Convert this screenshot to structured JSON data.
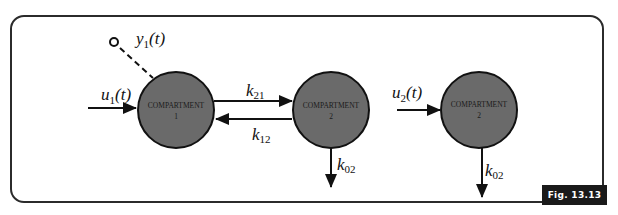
{
  "figure": {
    "label": "Fig. 13.13",
    "colors": {
      "compartment_fill": "#6a6a6a",
      "stroke": "#111111",
      "frame": "#2b2b2b",
      "label_bg": "#1a1a1a",
      "label_text": "#ffffff"
    }
  },
  "left_model": {
    "compartment1": {
      "name": "COMPARTMENT",
      "number": "1"
    },
    "compartment2": {
      "name": "COMPARTMENT",
      "number": "2"
    },
    "input": {
      "symbol": "u",
      "subscript": "1",
      "arg": "(t)"
    },
    "output": {
      "symbol": "y",
      "subscript": "1",
      "arg": "(t)"
    },
    "k21": {
      "symbol": "k",
      "subscript": "21"
    },
    "k12": {
      "symbol": "k",
      "subscript": "12"
    },
    "k02": {
      "symbol": "k",
      "subscript": "02"
    }
  },
  "right_model": {
    "compartment": {
      "name": "COMPARTMENT",
      "number": "2"
    },
    "input": {
      "symbol": "u",
      "subscript": "2",
      "arg": "(t)"
    },
    "k02": {
      "symbol": "k",
      "subscript": "02"
    }
  }
}
